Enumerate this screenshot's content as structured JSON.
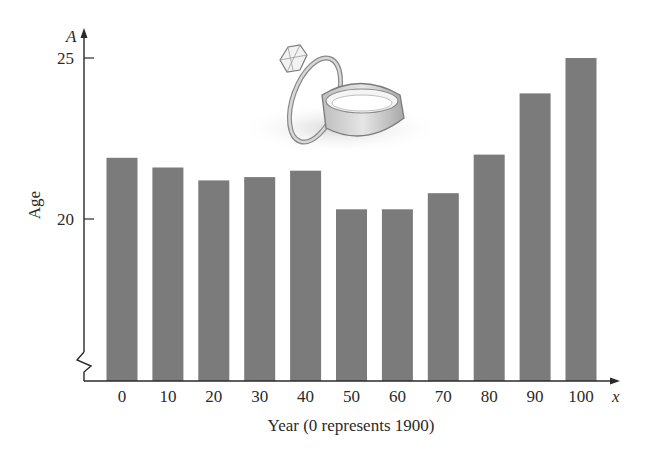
{
  "chart_data": {
    "type": "bar",
    "title": "",
    "xlabel": "Year (0 represents 1900)",
    "ylabel": "Age",
    "x_axis_variable": "x",
    "y_axis_variable": "A",
    "categories": [
      "0",
      "10",
      "20",
      "30",
      "40",
      "50",
      "60",
      "70",
      "80",
      "90",
      "100"
    ],
    "values": [
      21.9,
      21.6,
      21.2,
      21.3,
      21.5,
      20.3,
      20.3,
      20.8,
      22.0,
      23.9,
      25.0
    ],
    "yticks": [
      "20",
      "25"
    ],
    "ylim": [
      15.0,
      25.5
    ],
    "y_axis_break": true,
    "grid": false,
    "legend": null,
    "bar_color": "#7b7b7b",
    "annotations": [
      "illustration of two wedding rings"
    ]
  },
  "labels": {
    "ylabel": "Age",
    "xlabel": "Year (0 represents 1900)",
    "x_var": "x",
    "y_var": "A",
    "ytick_20": "20",
    "ytick_25": "25"
  }
}
